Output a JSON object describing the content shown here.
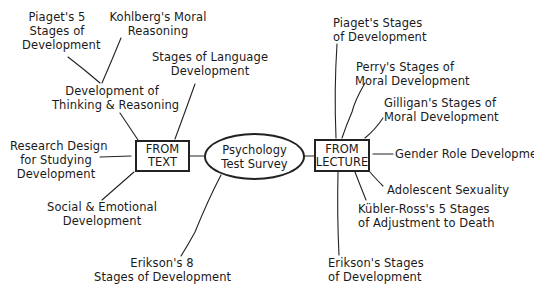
{
  "center": {
    "line1": "Psychology",
    "line2": "Test Survey"
  },
  "text_hub": {
    "line1": "FROM",
    "line2": "TEXT"
  },
  "lecture_hub": {
    "line1": "FROM",
    "line2": "LECTURE"
  },
  "text_topics": [
    {
      "line1": "Piaget's 5",
      "line2": "Stages of",
      "line3": "Development"
    },
    {
      "line1": "Kohlberg's Moral",
      "line2": "Reasoning"
    },
    {
      "line1": "Development of",
      "line2": "Thinking & Reasoning"
    },
    {
      "line1": "Stages of Language",
      "line2": "Development"
    },
    {
      "line1": "Research Design",
      "line2": "for Studying",
      "line3": "Development"
    },
    {
      "line1": "Social & Emotional",
      "line2": "Development"
    },
    {
      "line1": "Erikson's 8",
      "line2": "Stages of Development"
    }
  ],
  "lecture_topics": [
    {
      "line1": "Piaget's Stages",
      "line2": "of Development"
    },
    {
      "line1": "Perry's Stages of",
      "line2": "Moral Development"
    },
    {
      "line1": "Gilligan's Stages of",
      "line2": "Moral Development"
    },
    {
      "line1": "Gender Role Development"
    },
    {
      "line1": "Adolescent Sexuality"
    },
    {
      "line1": "Kübler-Ross's 5 Stages",
      "line2": "of Adjustment to Death"
    },
    {
      "line1": "Erikson's Stages",
      "line2": "of Development"
    }
  ]
}
